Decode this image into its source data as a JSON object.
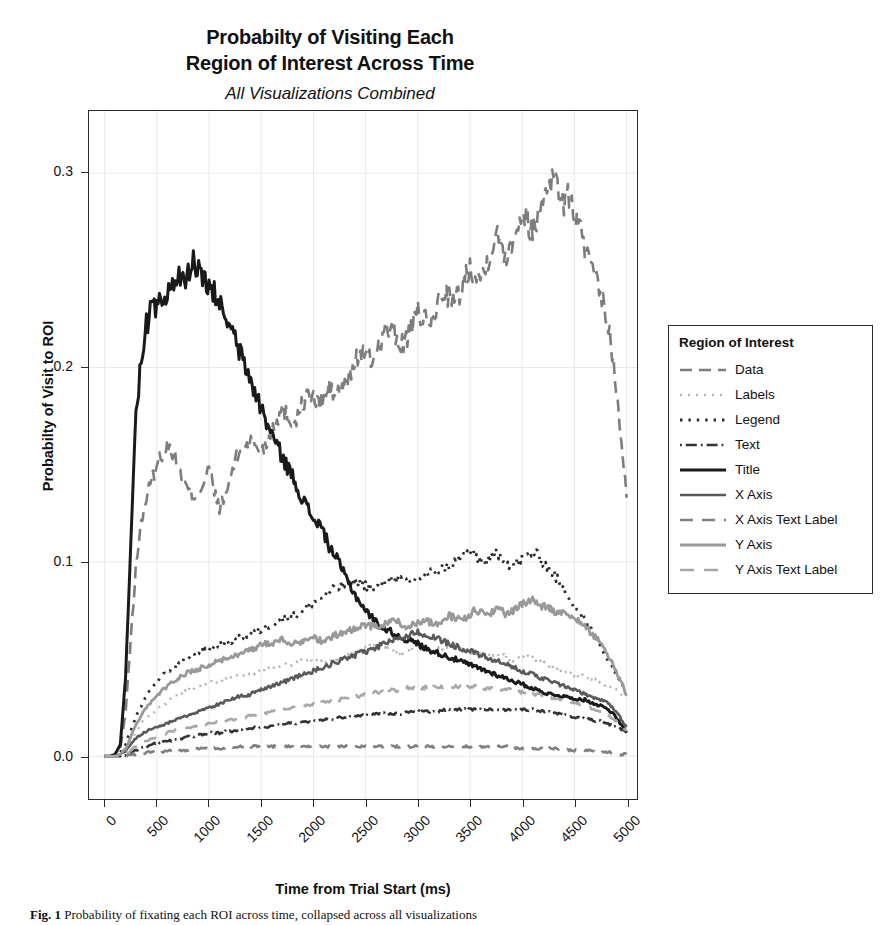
{
  "figure": {
    "title_line_1": "Probabilty of Visiting Each",
    "title_line_2": "Region of Interest Across Time",
    "subtitle": "All Visualizations Combined",
    "caption_label": "Fig. 1",
    "caption_text": "Probability of fixating each ROI across time, collapsed across all visualizations"
  },
  "chart_data": {
    "type": "line",
    "title": "Probabilty of Visiting Each Region of Interest Across Time",
    "subtitle": "All Visualizations Combined",
    "xlabel": "Time from Trial Start (ms)",
    "ylabel": "Probabilty of Visit to ROI",
    "xlim": [
      -150,
      5100
    ],
    "ylim": [
      -0.022,
      0.332
    ],
    "xticks": [
      0,
      500,
      1000,
      1500,
      2000,
      2500,
      3000,
      3500,
      4000,
      4500,
      5000
    ],
    "xtick_labels": [
      "0",
      "500",
      "1000",
      "1500",
      "2000",
      "2500",
      "3000",
      "3500",
      "4000",
      "4500",
      "5000"
    ],
    "yticks": [
      0.0,
      0.1,
      0.2,
      0.3
    ],
    "ytick_labels": [
      "0.0",
      "0.1",
      "0.2",
      "0.3"
    ],
    "grid": true,
    "grid_color": "#e8e8e8",
    "legend_position": "right-outside",
    "legend_title": "Region of Interest",
    "x": [
      0,
      50,
      100,
      150,
      200,
      250,
      300,
      350,
      400,
      450,
      500,
      550,
      600,
      650,
      700,
      750,
      800,
      850,
      900,
      950,
      1000,
      1050,
      1100,
      1150,
      1200,
      1250,
      1300,
      1350,
      1400,
      1450,
      1500,
      1550,
      1600,
      1650,
      1700,
      1750,
      1800,
      1850,
      1900,
      1950,
      2000,
      2050,
      2100,
      2150,
      2200,
      2250,
      2300,
      2350,
      2400,
      2450,
      2500,
      2550,
      2600,
      2650,
      2700,
      2750,
      2800,
      2850,
      2900,
      2950,
      3000,
      3050,
      3100,
      3150,
      3200,
      3250,
      3300,
      3350,
      3400,
      3450,
      3500,
      3550,
      3600,
      3650,
      3700,
      3750,
      3800,
      3850,
      3900,
      3950,
      4000,
      4050,
      4100,
      4150,
      4200,
      4250,
      4300,
      4350,
      4400,
      4450,
      4500,
      4550,
      4600,
      4650,
      4700,
      4750,
      4800,
      4850,
      4900,
      4950,
      5000
    ],
    "series": [
      {
        "name": "Data",
        "color": "#7d7d7d",
        "dash": "12,7",
        "width": 2.6,
        "values": [
          0.0,
          0.0,
          0.001,
          0.004,
          0.022,
          0.06,
          0.098,
          0.12,
          0.133,
          0.142,
          0.15,
          0.156,
          0.16,
          0.157,
          0.15,
          0.142,
          0.137,
          0.134,
          0.136,
          0.141,
          0.148,
          0.136,
          0.128,
          0.132,
          0.143,
          0.152,
          0.157,
          0.16,
          0.162,
          0.16,
          0.157,
          0.161,
          0.168,
          0.174,
          0.178,
          0.176,
          0.172,
          0.175,
          0.182,
          0.186,
          0.184,
          0.181,
          0.184,
          0.189,
          0.186,
          0.188,
          0.19,
          0.196,
          0.203,
          0.208,
          0.206,
          0.203,
          0.208,
          0.215,
          0.22,
          0.218,
          0.214,
          0.212,
          0.216,
          0.222,
          0.228,
          0.226,
          0.221,
          0.226,
          0.234,
          0.24,
          0.237,
          0.233,
          0.238,
          0.246,
          0.252,
          0.249,
          0.246,
          0.252,
          0.262,
          0.268,
          0.264,
          0.258,
          0.265,
          0.274,
          0.28,
          0.276,
          0.27,
          0.278,
          0.288,
          0.296,
          0.299,
          0.292,
          0.284,
          0.288,
          0.28,
          0.272,
          0.262,
          0.252,
          0.244,
          0.238,
          0.228,
          0.212,
          0.19,
          0.16,
          0.133
        ]
      },
      {
        "name": "Labels",
        "color": "#b4b4b4",
        "dash": "2,6",
        "width": 2.4,
        "values": [
          0.0,
          0.0,
          0.0,
          0.001,
          0.003,
          0.008,
          0.013,
          0.017,
          0.02,
          0.022,
          0.024,
          0.026,
          0.028,
          0.03,
          0.032,
          0.033,
          0.034,
          0.035,
          0.036,
          0.037,
          0.038,
          0.038,
          0.038,
          0.039,
          0.04,
          0.041,
          0.041,
          0.042,
          0.043,
          0.043,
          0.044,
          0.045,
          0.045,
          0.046,
          0.047,
          0.047,
          0.048,
          0.049,
          0.05,
          0.05,
          0.049,
          0.048,
          0.048,
          0.049,
          0.05,
          0.051,
          0.052,
          0.053,
          0.054,
          0.055,
          0.056,
          0.057,
          0.057,
          0.056,
          0.055,
          0.054,
          0.053,
          0.054,
          0.055,
          0.056,
          0.056,
          0.055,
          0.054,
          0.054,
          0.055,
          0.056,
          0.057,
          0.057,
          0.056,
          0.055,
          0.054,
          0.053,
          0.052,
          0.052,
          0.053,
          0.053,
          0.052,
          0.051,
          0.05,
          0.05,
          0.051,
          0.051,
          0.05,
          0.049,
          0.048,
          0.047,
          0.046,
          0.045,
          0.044,
          0.043,
          0.042,
          0.041,
          0.041,
          0.04,
          0.039,
          0.038,
          0.037,
          0.035,
          0.034,
          0.032,
          0.03
        ]
      },
      {
        "name": "Legend",
        "color": "#2b2b2b",
        "dash": "2.4,6",
        "width": 2.8,
        "values": [
          0.0,
          0.0,
          0.0,
          0.002,
          0.006,
          0.013,
          0.02,
          0.026,
          0.031,
          0.035,
          0.038,
          0.041,
          0.043,
          0.045,
          0.047,
          0.049,
          0.051,
          0.052,
          0.053,
          0.054,
          0.055,
          0.056,
          0.057,
          0.058,
          0.059,
          0.06,
          0.061,
          0.062,
          0.063,
          0.064,
          0.065,
          0.066,
          0.068,
          0.069,
          0.07,
          0.071,
          0.072,
          0.073,
          0.075,
          0.077,
          0.079,
          0.08,
          0.082,
          0.084,
          0.086,
          0.087,
          0.088,
          0.089,
          0.09,
          0.089,
          0.088,
          0.087,
          0.086,
          0.088,
          0.09,
          0.092,
          0.091,
          0.09,
          0.089,
          0.09,
          0.092,
          0.093,
          0.094,
          0.095,
          0.096,
          0.097,
          0.098,
          0.1,
          0.102,
          0.104,
          0.105,
          0.103,
          0.101,
          0.1,
          0.102,
          0.104,
          0.103,
          0.1,
          0.098,
          0.099,
          0.102,
          0.104,
          0.105,
          0.103,
          0.1,
          0.097,
          0.094,
          0.09,
          0.086,
          0.082,
          0.078,
          0.074,
          0.07,
          0.066,
          0.062,
          0.057,
          0.052,
          0.047,
          0.042,
          0.038,
          0.034
        ]
      },
      {
        "name": "Text",
        "color": "#333333",
        "dash": "1.8,4,11,4",
        "width": 2.6,
        "values": [
          0.0,
          0.0,
          0.0,
          0.0,
          0.001,
          0.002,
          0.003,
          0.004,
          0.005,
          0.006,
          0.007,
          0.007,
          0.008,
          0.008,
          0.009,
          0.009,
          0.01,
          0.01,
          0.011,
          0.011,
          0.012,
          0.012,
          0.012,
          0.013,
          0.013,
          0.013,
          0.014,
          0.014,
          0.014,
          0.015,
          0.015,
          0.015,
          0.016,
          0.016,
          0.016,
          0.017,
          0.017,
          0.017,
          0.018,
          0.018,
          0.018,
          0.018,
          0.019,
          0.019,
          0.019,
          0.02,
          0.02,
          0.02,
          0.021,
          0.021,
          0.021,
          0.021,
          0.022,
          0.022,
          0.022,
          0.022,
          0.022,
          0.022,
          0.023,
          0.023,
          0.023,
          0.023,
          0.023,
          0.023,
          0.023,
          0.024,
          0.024,
          0.024,
          0.024,
          0.024,
          0.024,
          0.024,
          0.024,
          0.024,
          0.024,
          0.024,
          0.024,
          0.024,
          0.024,
          0.024,
          0.024,
          0.024,
          0.024,
          0.023,
          0.023,
          0.023,
          0.022,
          0.022,
          0.021,
          0.021,
          0.02,
          0.02,
          0.019,
          0.019,
          0.018,
          0.018,
          0.017,
          0.016,
          0.015,
          0.014,
          0.013
        ]
      },
      {
        "name": "Title",
        "color": "#1a1a1a",
        "dash": "0",
        "width": 3.0,
        "values": [
          0.0,
          0.0,
          0.001,
          0.006,
          0.04,
          0.11,
          0.175,
          0.205,
          0.222,
          0.23,
          0.233,
          0.231,
          0.236,
          0.241,
          0.247,
          0.243,
          0.248,
          0.256,
          0.249,
          0.244,
          0.24,
          0.238,
          0.233,
          0.227,
          0.221,
          0.214,
          0.207,
          0.2,
          0.193,
          0.186,
          0.179,
          0.172,
          0.166,
          0.16,
          0.154,
          0.149,
          0.144,
          0.138,
          0.132,
          0.127,
          0.122,
          0.12,
          0.115,
          0.108,
          0.104,
          0.099,
          0.093,
          0.088,
          0.083,
          0.079,
          0.075,
          0.072,
          0.069,
          0.067,
          0.065,
          0.064,
          0.062,
          0.061,
          0.06,
          0.059,
          0.058,
          0.056,
          0.055,
          0.054,
          0.053,
          0.052,
          0.051,
          0.05,
          0.049,
          0.048,
          0.047,
          0.046,
          0.045,
          0.044,
          0.043,
          0.042,
          0.041,
          0.04,
          0.039,
          0.038,
          0.037,
          0.036,
          0.035,
          0.034,
          0.033,
          0.032,
          0.032,
          0.031,
          0.031,
          0.03,
          0.03,
          0.029,
          0.029,
          0.028,
          0.027,
          0.026,
          0.025,
          0.023,
          0.02,
          0.016,
          0.012
        ]
      },
      {
        "name": "X Axis",
        "color": "#595959",
        "dash": "0",
        "width": 2.6,
        "values": [
          0.0,
          0.0,
          0.0,
          0.001,
          0.003,
          0.006,
          0.009,
          0.011,
          0.013,
          0.014,
          0.015,
          0.016,
          0.017,
          0.018,
          0.019,
          0.02,
          0.021,
          0.022,
          0.023,
          0.024,
          0.025,
          0.026,
          0.027,
          0.028,
          0.029,
          0.03,
          0.031,
          0.031,
          0.032,
          0.033,
          0.034,
          0.035,
          0.036,
          0.037,
          0.038,
          0.039,
          0.04,
          0.041,
          0.042,
          0.043,
          0.044,
          0.045,
          0.046,
          0.047,
          0.048,
          0.049,
          0.05,
          0.051,
          0.052,
          0.053,
          0.054,
          0.055,
          0.056,
          0.057,
          0.058,
          0.059,
          0.06,
          0.061,
          0.062,
          0.063,
          0.064,
          0.063,
          0.062,
          0.061,
          0.06,
          0.059,
          0.058,
          0.057,
          0.056,
          0.055,
          0.054,
          0.053,
          0.052,
          0.051,
          0.05,
          0.049,
          0.048,
          0.047,
          0.046,
          0.045,
          0.044,
          0.043,
          0.042,
          0.041,
          0.04,
          0.039,
          0.038,
          0.037,
          0.036,
          0.035,
          0.034,
          0.033,
          0.032,
          0.031,
          0.03,
          0.029,
          0.028,
          0.026,
          0.023,
          0.019,
          0.015
        ]
      },
      {
        "name": "X Axis Text Label",
        "color": "#808080",
        "dash": "13,9",
        "width": 2.6,
        "values": [
          0.0,
          0.0,
          0.0,
          0.0,
          0.0,
          0.001,
          0.001,
          0.001,
          0.002,
          0.002,
          0.002,
          0.002,
          0.003,
          0.003,
          0.003,
          0.003,
          0.003,
          0.004,
          0.004,
          0.004,
          0.004,
          0.004,
          0.004,
          0.004,
          0.005,
          0.005,
          0.005,
          0.005,
          0.005,
          0.005,
          0.005,
          0.005,
          0.005,
          0.005,
          0.005,
          0.005,
          0.005,
          0.005,
          0.005,
          0.005,
          0.005,
          0.005,
          0.005,
          0.005,
          0.005,
          0.005,
          0.005,
          0.005,
          0.005,
          0.005,
          0.005,
          0.005,
          0.005,
          0.005,
          0.005,
          0.005,
          0.005,
          0.005,
          0.005,
          0.005,
          0.005,
          0.005,
          0.005,
          0.005,
          0.005,
          0.005,
          0.005,
          0.005,
          0.005,
          0.005,
          0.005,
          0.005,
          0.005,
          0.005,
          0.005,
          0.005,
          0.005,
          0.005,
          0.005,
          0.004,
          0.004,
          0.004,
          0.004,
          0.004,
          0.004,
          0.004,
          0.004,
          0.004,
          0.004,
          0.003,
          0.003,
          0.003,
          0.003,
          0.003,
          0.002,
          0.002,
          0.002,
          0.002,
          0.001,
          0.001,
          0.001
        ]
      },
      {
        "name": "Y Axis",
        "color": "#999999",
        "dash": "0",
        "width": 2.8,
        "values": [
          0.0,
          0.0,
          0.0,
          0.001,
          0.004,
          0.01,
          0.016,
          0.021,
          0.025,
          0.028,
          0.031,
          0.034,
          0.036,
          0.038,
          0.04,
          0.042,
          0.043,
          0.044,
          0.045,
          0.046,
          0.047,
          0.048,
          0.049,
          0.05,
          0.051,
          0.052,
          0.053,
          0.054,
          0.055,
          0.056,
          0.057,
          0.058,
          0.058,
          0.059,
          0.06,
          0.059,
          0.058,
          0.058,
          0.059,
          0.06,
          0.061,
          0.06,
          0.059,
          0.06,
          0.062,
          0.063,
          0.064,
          0.065,
          0.066,
          0.067,
          0.068,
          0.067,
          0.066,
          0.067,
          0.069,
          0.07,
          0.069,
          0.068,
          0.067,
          0.068,
          0.069,
          0.07,
          0.069,
          0.068,
          0.069,
          0.071,
          0.072,
          0.071,
          0.07,
          0.071,
          0.073,
          0.075,
          0.074,
          0.073,
          0.074,
          0.076,
          0.075,
          0.073,
          0.074,
          0.076,
          0.078,
          0.08,
          0.081,
          0.079,
          0.077,
          0.076,
          0.075,
          0.074,
          0.073,
          0.072,
          0.071,
          0.069,
          0.067,
          0.064,
          0.061,
          0.058,
          0.054,
          0.049,
          0.044,
          0.038,
          0.031
        ]
      },
      {
        "name": "Y Axis Text Label",
        "color": "#a8a8a8",
        "dash": "14,10",
        "width": 2.6,
        "values": [
          0.0,
          0.0,
          0.0,
          0.0,
          0.001,
          0.003,
          0.005,
          0.007,
          0.008,
          0.009,
          0.01,
          0.011,
          0.012,
          0.013,
          0.014,
          0.014,
          0.015,
          0.015,
          0.016,
          0.016,
          0.017,
          0.017,
          0.018,
          0.018,
          0.019,
          0.019,
          0.02,
          0.02,
          0.021,
          0.021,
          0.022,
          0.022,
          0.023,
          0.023,
          0.024,
          0.024,
          0.025,
          0.025,
          0.026,
          0.026,
          0.027,
          0.027,
          0.028,
          0.028,
          0.029,
          0.029,
          0.03,
          0.03,
          0.031,
          0.031,
          0.032,
          0.032,
          0.033,
          0.033,
          0.033,
          0.034,
          0.034,
          0.034,
          0.035,
          0.035,
          0.035,
          0.035,
          0.036,
          0.036,
          0.036,
          0.036,
          0.036,
          0.036,
          0.036,
          0.036,
          0.036,
          0.036,
          0.035,
          0.035,
          0.035,
          0.035,
          0.034,
          0.034,
          0.034,
          0.033,
          0.033,
          0.033,
          0.032,
          0.032,
          0.031,
          0.031,
          0.03,
          0.03,
          0.029,
          0.028,
          0.028,
          0.027,
          0.026,
          0.025,
          0.024,
          0.023,
          0.022,
          0.02,
          0.018,
          0.016,
          0.013
        ]
      }
    ]
  }
}
